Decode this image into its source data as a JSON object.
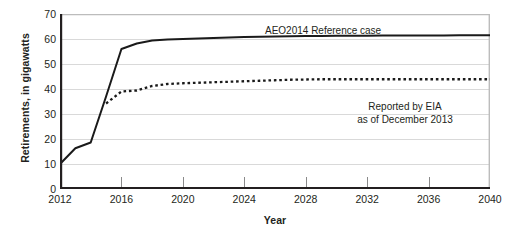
{
  "chart_data": {
    "type": "line",
    "title": "",
    "xlabel": "Year",
    "ylabel": "Retirements, in gigawatts",
    "xlim": [
      2012,
      2040
    ],
    "ylim": [
      0,
      70
    ],
    "grid": true,
    "legend_position": "inline-annotation",
    "x_ticks": [
      "2012",
      "2016",
      "2020",
      "2024",
      "2028",
      "2032",
      "2036",
      "2040"
    ],
    "x_tick_values": [
      2012,
      2016,
      2020,
      2024,
      2028,
      2032,
      2036,
      2040
    ],
    "y_ticks": [
      "0",
      "10",
      "20",
      "30",
      "40",
      "50",
      "60",
      "70"
    ],
    "y_tick_values": [
      0,
      10,
      20,
      30,
      40,
      50,
      60,
      70
    ],
    "x": [
      2012,
      2013,
      2014,
      2015,
      2016,
      2017,
      2018,
      2019,
      2020,
      2021,
      2022,
      2023,
      2024,
      2025,
      2026,
      2027,
      2028,
      2029,
      2030,
      2031,
      2032,
      2033,
      2034,
      2035,
      2036,
      2037,
      2038,
      2039,
      2040
    ],
    "series": [
      {
        "name": "AEO2014 Reference case",
        "style": "solid",
        "color": "#1a1a1a",
        "values": [
          10.0,
          16.3,
          18.6,
          37.0,
          56.0,
          58.2,
          59.4,
          59.8,
          60.0,
          60.2,
          60.4,
          60.6,
          60.8,
          60.9,
          61.0,
          61.1,
          61.2,
          61.2,
          61.3,
          61.3,
          61.3,
          61.4,
          61.4,
          61.4,
          61.4,
          61.4,
          61.5,
          61.5,
          61.5
        ]
      },
      {
        "name": "Reported by EIA as of December 2013",
        "style": "dotted",
        "color": "#1a1a1a",
        "values": [
          null,
          null,
          null,
          34.2,
          39.0,
          39.4,
          41.2,
          42.0,
          42.3,
          42.5,
          42.7,
          42.9,
          43.1,
          43.3,
          43.5,
          43.7,
          43.8,
          43.9,
          43.9,
          43.9,
          43.9,
          43.9,
          43.9,
          43.9,
          43.9,
          43.9,
          43.9,
          43.9,
          43.9
        ]
      }
    ],
    "annotations": [
      {
        "name": "series1-label",
        "text": "AEO2014 Reference case"
      },
      {
        "name": "series2-label",
        "text": "Reported by EIA\nas of December 2013"
      }
    ]
  }
}
